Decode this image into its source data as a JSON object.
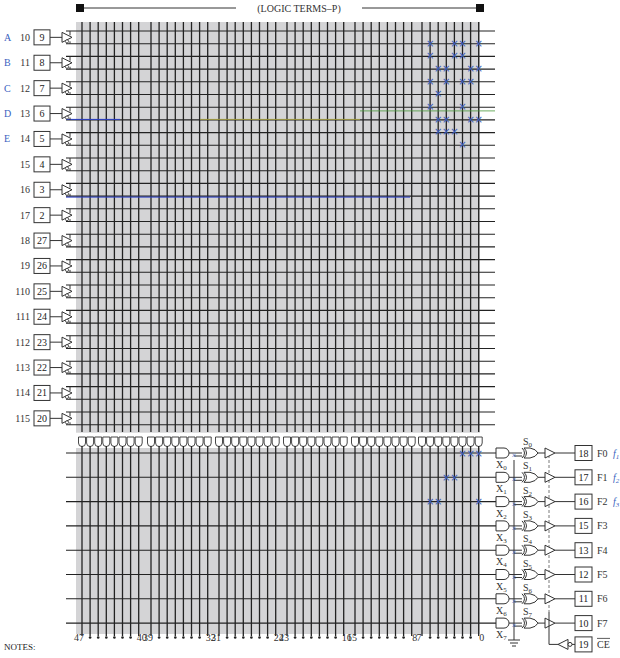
{
  "title": "(LOGIC TERMS–P)",
  "notes_label": "NOTES:",
  "colors": {
    "array_fill": "#d4d4d6",
    "line": "#222222",
    "fuse_mark": "#3b5fc0",
    "label_blue": "#3b5fc0",
    "highlight_blue": "#2b3fc8",
    "highlight_green": "#4a9a3a",
    "highlight_yellow": "#b8b040"
  },
  "inputs": [
    {
      "var": "A",
      "name": "I0",
      "pin": "9"
    },
    {
      "var": "B",
      "name": "I1",
      "pin": "8"
    },
    {
      "var": "C",
      "name": "I2",
      "pin": "7"
    },
    {
      "var": "D",
      "name": "I3",
      "pin": "6"
    },
    {
      "var": "E",
      "name": "I4",
      "pin": "5"
    },
    {
      "var": "",
      "name": "I5",
      "pin": "4"
    },
    {
      "var": "",
      "name": "I6",
      "pin": "3"
    },
    {
      "var": "",
      "name": "I7",
      "pin": "2"
    },
    {
      "var": "",
      "name": "I8",
      "pin": "27"
    },
    {
      "var": "",
      "name": "I9",
      "pin": "26"
    },
    {
      "var": "",
      "name": "I10",
      "pin": "25"
    },
    {
      "var": "",
      "name": "I11",
      "pin": "24"
    },
    {
      "var": "",
      "name": "I12",
      "pin": "23"
    },
    {
      "var": "",
      "name": "I13",
      "pin": "22"
    },
    {
      "var": "",
      "name": "I14",
      "pin": "21"
    },
    {
      "var": "",
      "name": "I15",
      "pin": "20"
    }
  ],
  "input_labels_display": [
    "10",
    "11",
    "12",
    "13",
    "14",
    "15",
    "16",
    "17",
    "18",
    "19",
    "110",
    "111",
    "112",
    "113",
    "114",
    "115"
  ],
  "product_terms": {
    "count": 48,
    "groups": 6,
    "axis_labels": [
      "47",
      "40",
      "39",
      "32",
      "31",
      "24",
      "23",
      "16",
      "15",
      "8",
      "7",
      "0"
    ]
  },
  "and_array_fuses": [
    {
      "row": 0,
      "cols": [
        6,
        3,
        2,
        0
      ]
    },
    {
      "row": 1,
      "cols": [
        6,
        3,
        2
      ]
    },
    {
      "row": 2,
      "cols": [
        5,
        4,
        1,
        0
      ]
    },
    {
      "row": 3,
      "cols": [
        6,
        4,
        2,
        1
      ]
    },
    {
      "row": 4,
      "cols": [
        5
      ]
    },
    {
      "row": 5,
      "cols": [
        6,
        2
      ]
    },
    {
      "row": 6,
      "cols": [
        5,
        4,
        1,
        0
      ]
    },
    {
      "row": 7,
      "cols": [
        5,
        4,
        3
      ]
    },
    {
      "row": 8,
      "cols": [
        2
      ]
    }
  ],
  "or_array_fuses": [
    {
      "output": 0,
      "cols": [
        2,
        1,
        0
      ]
    },
    {
      "output": 1,
      "cols": [
        4,
        3
      ]
    },
    {
      "output": 2,
      "cols": [
        6,
        5,
        0
      ]
    }
  ],
  "outputs": [
    {
      "x": "X0",
      "s": "S0",
      "pin": "18",
      "name": "F0",
      "func": "f1"
    },
    {
      "x": "X1",
      "s": "S1",
      "pin": "17",
      "name": "F1",
      "func": "f2"
    },
    {
      "x": "X2",
      "s": "S2",
      "pin": "16",
      "name": "F2",
      "func": "f3"
    },
    {
      "x": "X3",
      "s": "S3",
      "pin": "15",
      "name": "F3",
      "func": ""
    },
    {
      "x": "X4",
      "s": "S4",
      "pin": "13",
      "name": "F4",
      "func": ""
    },
    {
      "x": "X5",
      "s": "S5",
      "pin": "12",
      "name": "F5",
      "func": ""
    },
    {
      "x": "X6",
      "s": "S6",
      "pin": "11",
      "name": "F6",
      "func": ""
    },
    {
      "x": "X7",
      "s": "S7",
      "pin": "10",
      "name": "F7",
      "func": ""
    }
  ],
  "chip_enable": {
    "pin": "19",
    "name": "CE",
    "overbar": true
  }
}
